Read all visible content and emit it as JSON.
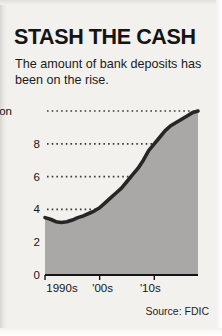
{
  "headline": "STASH THE CASH",
  "subhead": "The amount of bank deposits has been on the rise.",
  "source": "Source: FDIC",
  "colors": {
    "paper": "#f2f1ee",
    "ink": "#141414",
    "area_fill": "#a9a8a6",
    "line": "#262626",
    "gridline": "#3a3a3a"
  },
  "chart_data": {
    "type": "area",
    "title": "STASH THE CASH",
    "subtitle": "The amount of bank deposits has been on the rise.",
    "xlabel": "",
    "ylabel": "",
    "top_axis_label": "$10 trillion",
    "ytick_labels": [
      "0",
      "2",
      "4",
      "6",
      "8",
      "$10 trillion"
    ],
    "ytick_values": [
      0,
      2,
      4,
      6,
      8,
      10
    ],
    "ylim": [
      0,
      10
    ],
    "xtick_labels": [
      "1990s",
      "'00s",
      "'10s"
    ],
    "xtick_values": [
      1990,
      2000,
      2010
    ],
    "xlim": [
      1990,
      2018
    ],
    "grid": "dotted-horizontal",
    "legend": "none",
    "units": "trillions of US dollars",
    "x": [
      1990,
      1991,
      1992,
      1993,
      1994,
      1995,
      1996,
      1997,
      1998,
      1999,
      2000,
      2001,
      2002,
      2003,
      2004,
      2005,
      2006,
      2007,
      2008,
      2009,
      2010,
      2011,
      2012,
      2013,
      2014,
      2015,
      2016,
      2017,
      2018
    ],
    "values": [
      3.5,
      3.4,
      3.25,
      3.2,
      3.25,
      3.35,
      3.5,
      3.6,
      3.75,
      3.9,
      4.1,
      4.4,
      4.7,
      5.0,
      5.3,
      5.7,
      6.1,
      6.5,
      7.0,
      7.6,
      8.0,
      8.4,
      8.8,
      9.1,
      9.3,
      9.5,
      9.7,
      9.9,
      10.0
    ],
    "series": [
      {
        "name": "Bank deposits",
        "values": [
          3.5,
          3.4,
          3.25,
          3.2,
          3.25,
          3.35,
          3.5,
          3.6,
          3.75,
          3.9,
          4.1,
          4.4,
          4.7,
          5.0,
          5.3,
          5.7,
          6.1,
          6.5,
          7.0,
          7.6,
          8.0,
          8.4,
          8.8,
          9.1,
          9.3,
          9.5,
          9.7,
          9.9,
          10.0
        ]
      }
    ]
  }
}
